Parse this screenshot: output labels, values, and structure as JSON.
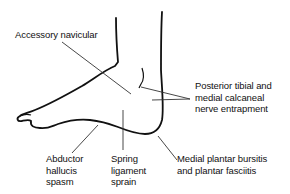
{
  "diagram": {
    "labels": {
      "accessory_navicular": {
        "lines": [
          "Accessory navicular"
        ]
      },
      "posterior_tibial": {
        "lines": [
          "Posterior tibial and",
          "medial calcaneal",
          "nerve entrapment"
        ]
      },
      "abductor_hallucis": {
        "lines": [
          "Abductor",
          "hallucis",
          "spasm"
        ]
      },
      "spring_ligament": {
        "lines": [
          "Spring",
          "ligament",
          "sprain"
        ]
      },
      "medial_plantar": {
        "lines": [
          "Medial plantar bursitis",
          "and plantar fasciitis"
        ]
      }
    },
    "colors": {
      "outline": "#111111",
      "leader": "#333333",
      "background": "#ffffff"
    }
  }
}
